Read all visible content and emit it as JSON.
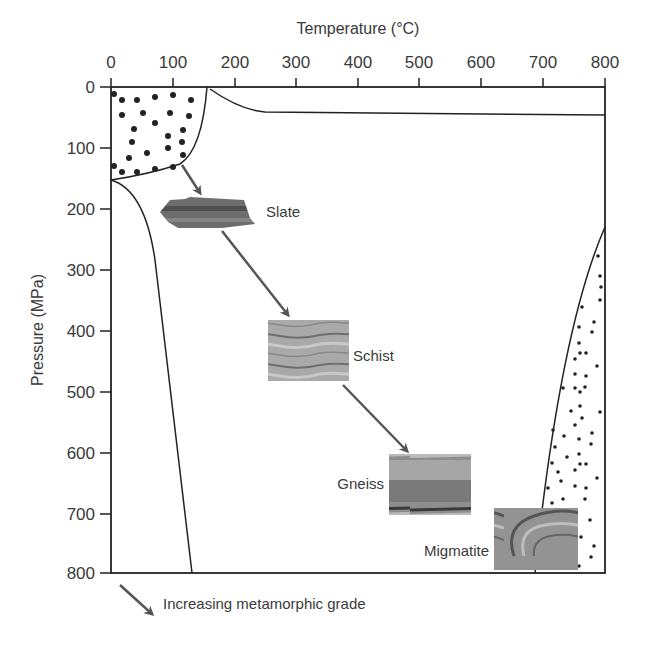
{
  "diagram": {
    "x_axis": {
      "title": "Temperature (°C)",
      "ticks": [
        "0",
        "100",
        "200",
        "300",
        "400",
        "500",
        "600",
        "700",
        "800"
      ]
    },
    "y_axis": {
      "title": "Pressure (MPa)",
      "ticks": [
        "0",
        "100",
        "200",
        "300",
        "400",
        "500",
        "600",
        "700",
        "800"
      ]
    },
    "rocks": [
      {
        "name": "Slate"
      },
      {
        "name": "Schist"
      },
      {
        "name": "Gneiss"
      },
      {
        "name": "Migmatite"
      }
    ],
    "legend": {
      "arrow_label": "Increasing metamorphic grade"
    },
    "colors": {
      "line": "#222222",
      "arrow": "#555555",
      "text": "#3a3a3a"
    }
  }
}
